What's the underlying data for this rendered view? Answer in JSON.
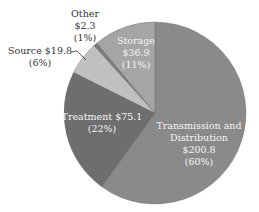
{
  "chart_data": {
    "type": "pie",
    "title": "",
    "start_angle_deg": 0,
    "direction": "clockwise",
    "center": [
      155,
      113
    ],
    "radius": 91,
    "slices": [
      {
        "name": "Transmission and Distribution",
        "value": 200.8,
        "percent": 60,
        "color": "#8a8a8a",
        "label_lines": [
          "Transmission and",
          "Distribution",
          "$200.8",
          "(60%)"
        ],
        "label_pos": "inside"
      },
      {
        "name": "Treatment",
        "value": 75.1,
        "percent": 22,
        "color": "#6e6e6e",
        "label_lines": [
          "Treatment $75.1",
          "(22%)"
        ],
        "label_pos": "inside"
      },
      {
        "name": "Source",
        "value": 19.8,
        "percent": 6,
        "color": "#c0c0c0",
        "label_lines": [
          "Source $19.8",
          "(6%)"
        ],
        "label_pos": "outside-leader"
      },
      {
        "name": "Other",
        "value": 2.3,
        "percent": 1,
        "color": "#7a7a7a",
        "label_lines": [
          "Other",
          "$2.3",
          "(1%)"
        ],
        "label_pos": "outside"
      },
      {
        "name": "Storage",
        "value": 36.9,
        "percent": 11,
        "color": "#a5a5a5",
        "label_lines": [
          "Storage",
          "$36.9",
          "(11%)"
        ],
        "label_pos": "inside"
      }
    ],
    "categories": [
      "Transmission and Distribution",
      "Treatment",
      "Source",
      "Other",
      "Storage"
    ],
    "values": [
      200.8,
      75.1,
      19.8,
      2.3,
      36.9
    ],
    "legend": "none"
  },
  "labels": {
    "transmission": {
      "l1": "Transmission and",
      "l2": "Distribution",
      "l3": "$200.8",
      "l4": "(60%)"
    },
    "treatment": {
      "l1": "Treatment $75.1",
      "l2": "(22%)"
    },
    "source": {
      "l1": "Source $19.8",
      "l2": "(6%)"
    },
    "other": {
      "l1": "Other",
      "l2": "$2.3",
      "l3": "(1%)"
    },
    "storage": {
      "l1": "Storage",
      "l2": "$36.9",
      "l3": "(11%)"
    }
  }
}
